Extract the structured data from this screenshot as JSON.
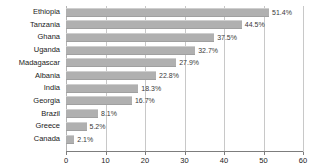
{
  "chart_data": {
    "type": "bar",
    "orientation": "horizontal",
    "title": "",
    "xlabel": "",
    "ylabel": "",
    "xlim": [
      0,
      60
    ],
    "ylim": null,
    "grid": true,
    "legend": false,
    "value_suffix": "%",
    "xticks": [
      0,
      10,
      20,
      30,
      40,
      50,
      60
    ],
    "xtick_labels": [
      "0",
      "10",
      "20",
      "30",
      "40",
      "50",
      "60"
    ],
    "categories": [
      "Ethiopia",
      "Tanzania",
      "Ghana",
      "Uganda",
      "Madagascar",
      "Albania",
      "India",
      "Georgia",
      "Brazil",
      "Greece",
      "Canada"
    ],
    "values": [
      51.4,
      44.5,
      37.5,
      32.7,
      27.9,
      22.8,
      18.3,
      16.7,
      8.1,
      5.2,
      2.1
    ],
    "data_labels": [
      "51.4%",
      "44.5%",
      "37.5%",
      "32.7%",
      "27.9%",
      "22.8%",
      "18.3%",
      "16.7%",
      "8.1%",
      "5.2%",
      "2.1%"
    ],
    "colors": {
      "bar": "#b0b0b0",
      "bar_edge_light": "#cfcfcf",
      "bar_edge_dark": "#a0a0a0",
      "gridline": "#c8c8c8",
      "axis": "#7d7d7d",
      "text": "#1a1a1a",
      "value_text": "#3a3a3a",
      "background": "#ffffff"
    }
  }
}
